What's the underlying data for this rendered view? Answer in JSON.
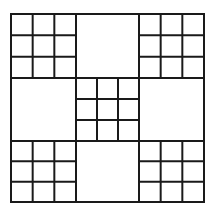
{
  "diagram": {
    "stroke_color": "#1a1a1a",
    "background": "#ffffff",
    "outer": {
      "x": 11,
      "y": 14,
      "width": 193,
      "height": 188
    },
    "major_cols": [
      11,
      76,
      139,
      204
    ],
    "major_rows": [
      14,
      78,
      141,
      202
    ],
    "subdivided_blocks": [
      {
        "name": "top-left",
        "col": 0,
        "row": 0
      },
      {
        "name": "top-right",
        "col": 2,
        "row": 0
      },
      {
        "name": "center",
        "col": 1,
        "row": 1
      },
      {
        "name": "bottom-left",
        "col": 0,
        "row": 2
      },
      {
        "name": "bottom-right",
        "col": 2,
        "row": 2
      }
    ],
    "empty_blocks": [
      {
        "name": "top-middle",
        "col": 1,
        "row": 0
      },
      {
        "name": "middle-left",
        "col": 0,
        "row": 1
      },
      {
        "name": "middle-right",
        "col": 2,
        "row": 1
      },
      {
        "name": "bottom-middle",
        "col": 1,
        "row": 2
      }
    ],
    "subdivisions": 3
  }
}
